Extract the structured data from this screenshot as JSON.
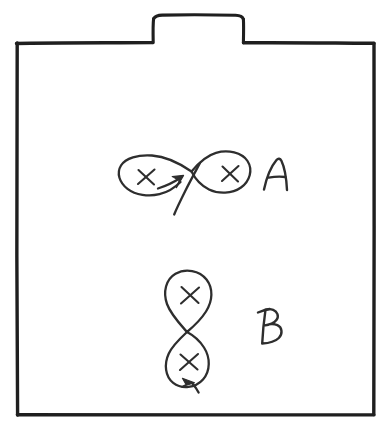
{
  "image": {
    "kind": "hand-drawn-sketch",
    "medium": "pen on white paper",
    "width": 388,
    "height": 432,
    "background_color": "#ffffff",
    "ink_color": "#2e2e2e",
    "frame_color": "#1f1f1f",
    "description": "A hand-drawn rectangular box with a small tab on top, containing two labelled figure-eight (lemniscate) loop diagrams with X marks and direction arrows."
  },
  "frame": {
    "name": "outer-box",
    "label": "",
    "tab": {
      "name": "top-tab",
      "label": ""
    }
  },
  "figures": [
    {
      "id": "A",
      "label": "A",
      "orientation": "horizontal",
      "shape": "figure-eight",
      "crossing_point": [
        191,
        172
      ],
      "loops": [
        {
          "position": "left",
          "x_mark_center": [
            146,
            177
          ],
          "x_mark": "×"
        },
        {
          "position": "right",
          "x_mark_center": [
            230,
            174
          ],
          "x_mark": "×"
        }
      ],
      "arrow": {
        "name": "direction-arrow",
        "direction": "up-right",
        "tip": [
          183,
          178
        ]
      },
      "tail": {
        "from": [
          183,
          215
        ],
        "to": [
          191,
          172
        ]
      },
      "label_position": [
        272,
        175
      ]
    },
    {
      "id": "B",
      "label": "B",
      "orientation": "vertical",
      "shape": "figure-eight",
      "crossing_point": [
        187,
        332
      ],
      "loops": [
        {
          "position": "top",
          "x_mark_center": [
            190,
            295
          ],
          "x_mark": "×"
        },
        {
          "position": "bottom",
          "x_mark_center": [
            189,
            362
          ],
          "x_mark": "×"
        }
      ],
      "arrow": {
        "name": "direction-arrow",
        "direction": "right-down",
        "tip": [
          193,
          382
        ]
      },
      "tail": {
        "from": [
          198,
          392
        ],
        "to": [
          193,
          382
        ]
      },
      "label_position": [
        266,
        325
      ]
    }
  ],
  "annotations": {
    "x_glyph": "×",
    "letters": [
      "A",
      "B"
    ]
  }
}
